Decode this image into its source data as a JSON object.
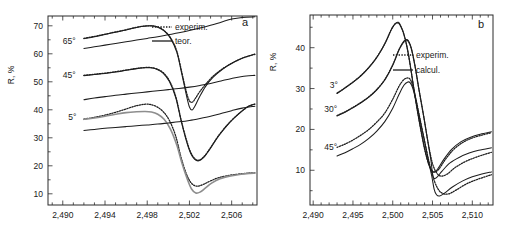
{
  "figure": {
    "background": "#ffffff",
    "curve_color": "#1d1d1d",
    "gray_curve_color": "#8e8e8e",
    "axis_color": "#2b2b2b"
  },
  "chart_data": [
    {
      "type": "line",
      "panel_letter": "a",
      "title": "",
      "xlabel": "",
      "ylabel": "R, %",
      "xlim": [
        2488.6,
        2508.4
      ],
      "ylim": [
        6.0,
        73.5
      ],
      "xticks": [
        2490,
        2494,
        2498,
        2502,
        2506
      ],
      "xtick_labels": [
        "2,490",
        "2,494",
        "2,498",
        "2,502",
        "2,506"
      ],
      "xminor_step": 1,
      "yticks": [
        10,
        20,
        30,
        40,
        50,
        60,
        70
      ],
      "ytick_labels": [
        "10",
        "20",
        "30",
        "40",
        "50",
        "60",
        "70"
      ],
      "yminor_step": 5,
      "grid": false,
      "legend_position": "top-right",
      "legend": [
        {
          "label": "experim.",
          "style": "dotted"
        },
        {
          "label": "teor.",
          "style": "solid"
        }
      ],
      "annotations": [
        {
          "text": "65°",
          "x": 2490.6,
          "y": 63.5
        },
        {
          "text": "45°",
          "x": 2490.6,
          "y": 51.5
        },
        {
          "text": "5°",
          "x": 2490.9,
          "y": 36.5
        }
      ],
      "series": [
        {
          "name": "65° experim.",
          "angle": "65°",
          "style": "dotted",
          "color": "#1d1d1d",
          "x": [
            2492.0,
            2493.0,
            2494.0,
            2495.0,
            2496.0,
            2497.0,
            2497.8,
            2498.4,
            2499.0,
            2499.6,
            2500.2,
            2500.8,
            2501.3,
            2501.7,
            2502.0,
            2502.3,
            2502.6,
            2503.0,
            2503.6,
            2504.3,
            2505.2,
            2506.2,
            2507.2,
            2508.2
          ],
          "y": [
            65.5,
            66.2,
            67.0,
            67.8,
            68.6,
            69.5,
            69.9,
            70.0,
            69.6,
            68.3,
            65.8,
            61.0,
            53.0,
            46.5,
            43.2,
            42.8,
            44.3,
            46.6,
            49.4,
            52.2,
            54.8,
            57.0,
            58.7,
            59.8
          ]
        },
        {
          "name": "65° teor.",
          "angle": "65°",
          "style": "solid",
          "color": "#1d1d1d",
          "x": [
            2492.0,
            2493.0,
            2494.0,
            2495.0,
            2496.0,
            2497.0,
            2497.8,
            2498.4,
            2499.0,
            2499.6,
            2500.2,
            2500.8,
            2501.3,
            2501.7,
            2502.0,
            2502.25,
            2502.5,
            2502.9,
            2503.5,
            2504.2,
            2505.1,
            2506.1,
            2507.1,
            2508.2
          ],
          "y": [
            65.4,
            66.1,
            66.9,
            67.7,
            68.5,
            69.4,
            69.9,
            70.0,
            69.5,
            68.2,
            65.6,
            60.6,
            52.4,
            45.4,
            41.0,
            39.9,
            41.2,
            44.2,
            48.2,
            51.5,
            54.4,
            56.8,
            58.6,
            59.9
          ]
        },
        {
          "name": "65° lower branch",
          "angle": "65°",
          "style": "solid",
          "color": "#1d1d1d",
          "x": [
            2492.0,
            2493.0,
            2494.0,
            2495.0,
            2496.0,
            2497.0,
            2498.0,
            2499.0,
            2500.0,
            2501.0,
            2502.0,
            2503.0,
            2504.0,
            2505.0,
            2506.0,
            2507.0,
            2508.2
          ],
          "y": [
            61.9,
            62.5,
            63.1,
            63.7,
            64.3,
            64.9,
            65.5,
            66.1,
            66.8,
            67.5,
            68.3,
            69.2,
            70.2,
            71.3,
            72.4,
            73.0,
            73.2
          ]
        },
        {
          "name": "45° experim.",
          "angle": "45°",
          "style": "dotted",
          "color": "#1d1d1d",
          "x": [
            2492.0,
            2493.0,
            2494.0,
            2495.0,
            2496.0,
            2497.0,
            2497.8,
            2498.3,
            2498.9,
            2499.5,
            2500.1,
            2500.7,
            2501.2,
            2501.7,
            2502.1,
            2502.5,
            2502.9,
            2503.4,
            2504.0,
            2504.8,
            2505.8,
            2506.8,
            2507.6,
            2508.2
          ],
          "y": [
            52.3,
            52.7,
            53.1,
            53.6,
            54.2,
            54.8,
            55.1,
            55.1,
            54.6,
            53.3,
            50.4,
            44.8,
            36.6,
            29.5,
            25.0,
            22.6,
            22.0,
            23.4,
            26.5,
            31.0,
            35.5,
            39.0,
            41.2,
            42.0
          ]
        },
        {
          "name": "45° teor.",
          "angle": "45°",
          "style": "solid",
          "color": "#1d1d1d",
          "x": [
            2492.0,
            2493.0,
            2494.0,
            2495.0,
            2496.0,
            2497.0,
            2497.8,
            2498.3,
            2498.9,
            2499.5,
            2500.1,
            2500.7,
            2501.2,
            2501.7,
            2502.1,
            2502.5,
            2502.9,
            2503.4,
            2504.0,
            2504.8,
            2505.8,
            2506.8,
            2507.6,
            2508.2
          ],
          "y": [
            52.2,
            52.6,
            53.0,
            53.5,
            54.1,
            54.7,
            55.0,
            55.0,
            54.5,
            53.1,
            50.1,
            44.4,
            36.2,
            29.0,
            24.6,
            22.3,
            21.8,
            23.2,
            26.3,
            30.8,
            35.4,
            39.0,
            41.3,
            42.1
          ]
        },
        {
          "name": "45° lower branch",
          "angle": "45°",
          "style": "solid",
          "color": "#1d1d1d",
          "x": [
            2492.0,
            2493.0,
            2494.0,
            2495.0,
            2496.0,
            2497.0,
            2498.0,
            2499.0,
            2500.0,
            2501.0,
            2502.0,
            2503.0,
            2504.0,
            2505.0,
            2506.0,
            2507.0,
            2508.2
          ],
          "y": [
            43.6,
            44.2,
            44.7,
            45.2,
            45.6,
            46.0,
            46.4,
            46.8,
            47.2,
            47.6,
            48.1,
            48.7,
            49.4,
            50.3,
            51.2,
            51.9,
            52.3
          ]
        },
        {
          "name": "5° experim.",
          "angle": "5°",
          "style": "dotted",
          "color": "#1d1d1d",
          "x": [
            2492.0,
            2493.0,
            2494.0,
            2495.0,
            2496.0,
            2497.0,
            2497.8,
            2498.3,
            2498.9,
            2499.5,
            2500.1,
            2500.7,
            2501.2,
            2501.7,
            2502.1,
            2502.5,
            2502.9,
            2503.4,
            2504.0,
            2504.8,
            2505.8,
            2506.8,
            2507.6,
            2508.2
          ],
          "y": [
            36.7,
            37.3,
            38.1,
            39.1,
            40.3,
            41.5,
            42.0,
            41.9,
            41.1,
            39.4,
            36.2,
            30.6,
            23.1,
            17.2,
            14.2,
            12.9,
            12.8,
            13.5,
            14.6,
            15.8,
            16.6,
            17.1,
            17.4,
            17.5
          ]
        },
        {
          "name": "5° teor.",
          "angle": "5°",
          "style": "solid",
          "color": "#8e8e8e",
          "x": [
            2492.0,
            2493.0,
            2494.0,
            2495.0,
            2496.0,
            2497.0,
            2497.8,
            2498.4,
            2499.0,
            2499.6,
            2500.2,
            2500.8,
            2501.3,
            2501.8,
            2502.2,
            2502.6,
            2503.0,
            2503.5,
            2504.1,
            2504.9,
            2505.9,
            2506.9,
            2507.7,
            2508.2
          ],
          "y": [
            36.6,
            37.1,
            37.7,
            38.4,
            39.0,
            39.3,
            39.4,
            39.2,
            38.4,
            36.6,
            33.1,
            27.4,
            20.8,
            15.2,
            11.7,
            10.3,
            10.6,
            12.0,
            13.8,
            15.4,
            16.4,
            17.0,
            17.3,
            17.4
          ]
        },
        {
          "name": "5° lower branch",
          "angle": "5°",
          "style": "solid",
          "color": "#1d1d1d",
          "x": [
            2492.0,
            2493.0,
            2494.0,
            2495.0,
            2496.0,
            2497.0,
            2498.0,
            2499.0,
            2500.0,
            2501.0,
            2502.0,
            2503.0,
            2504.0,
            2505.0,
            2506.0,
            2507.0,
            2508.2
          ],
          "y": [
            32.6,
            33.0,
            33.4,
            33.7,
            34.0,
            34.3,
            34.6,
            34.9,
            35.3,
            35.7,
            36.2,
            36.9,
            37.7,
            38.7,
            39.7,
            40.6,
            41.3
          ]
        }
      ]
    },
    {
      "type": "line",
      "panel_letter": "b",
      "title": "",
      "xlabel": "",
      "ylabel": "R, %",
      "xlim": [
        2489.6,
        2512.6
      ],
      "ylim": [
        1.5,
        48.0
      ],
      "xticks": [
        2490,
        2495,
        2500,
        2505,
        2510
      ],
      "xtick_labels": [
        "2,490",
        "2,495",
        "2,500",
        "2,505",
        "2,510"
      ],
      "xminor_step": 1,
      "yticks": [
        10,
        20,
        30,
        40
      ],
      "ytick_labels": [
        "10",
        "20",
        "30",
        "40"
      ],
      "yminor_step": 5,
      "grid": false,
      "legend_position": "center-right",
      "legend": [
        {
          "label": "experim.",
          "style": "dotted"
        },
        {
          "label": "calcul.",
          "style": "solid"
        }
      ],
      "annotations": [
        {
          "text": "3°",
          "x": 2492.6,
          "y": 30.2
        },
        {
          "text": "30°",
          "x": 2492.2,
          "y": 24.2
        },
        {
          "text": "45°",
          "x": 2492.2,
          "y": 15.0
        }
      ],
      "series": [
        {
          "name": "3° experim.",
          "angle": "3°",
          "style": "dotted",
          "color": "#1d1d1d",
          "x": [
            2493.0,
            2494.0,
            2495.0,
            2496.0,
            2497.0,
            2498.0,
            2499.0,
            2499.8,
            2500.3,
            2500.7,
            2501.0,
            2501.4,
            2501.8,
            2502.2,
            2502.8,
            2503.4,
            2504.0,
            2504.5,
            2504.9,
            2505.3,
            2505.8,
            2506.6,
            2507.6,
            2508.8,
            2510.0,
            2511.2,
            2512.4
          ],
          "y": [
            28.9,
            30.2,
            31.6,
            33.2,
            35.2,
            37.7,
            41.0,
            44.4,
            45.8,
            46.0,
            45.2,
            43.2,
            40.0,
            35.6,
            28.0,
            21.2,
            15.2,
            11.6,
            10.0,
            9.6,
            10.3,
            12.6,
            15.0,
            16.8,
            17.9,
            18.6,
            19.2
          ]
        },
        {
          "name": "3° calcul.",
          "angle": "3°",
          "style": "solid",
          "color": "#1d1d1d",
          "x": [
            2493.0,
            2494.0,
            2495.0,
            2496.0,
            2497.0,
            2498.0,
            2499.0,
            2499.8,
            2500.3,
            2500.7,
            2501.0,
            2501.4,
            2501.8,
            2502.2,
            2502.8,
            2503.4,
            2504.0,
            2504.5,
            2504.9,
            2505.2,
            2505.6,
            2506.4,
            2507.4,
            2508.6,
            2509.8,
            2511.0,
            2512.4
          ],
          "y": [
            28.8,
            30.1,
            31.5,
            33.1,
            35.1,
            37.6,
            40.9,
            44.3,
            45.9,
            46.2,
            45.4,
            43.4,
            40.2,
            35.8,
            28.2,
            21.4,
            15.4,
            11.6,
            9.9,
            9.5,
            10.2,
            12.6,
            15.1,
            17.0,
            18.1,
            18.8,
            19.4
          ]
        },
        {
          "name": "30° experim.",
          "angle": "30°",
          "style": "dotted",
          "color": "#1d1d1d",
          "x": [
            2493.0,
            2494.0,
            2495.0,
            2496.0,
            2497.0,
            2498.0,
            2499.0,
            2500.0,
            2500.8,
            2501.4,
            2501.8,
            2502.1,
            2502.4,
            2502.8,
            2503.3,
            2503.9,
            2504.4,
            2504.8,
            2505.1,
            2505.5,
            2506.0,
            2506.8,
            2507.8,
            2509.0,
            2510.2,
            2511.4,
            2512.4
          ],
          "y": [
            23.4,
            24.3,
            25.4,
            26.6,
            28.0,
            29.8,
            32.2,
            35.8,
            39.5,
            41.4,
            41.8,
            41.0,
            39.2,
            35.4,
            29.6,
            23.0,
            17.2,
            13.2,
            11.0,
            9.4,
            8.6,
            9.0,
            10.6,
            12.0,
            13.0,
            13.8,
            14.4
          ]
        },
        {
          "name": "30° calcul.",
          "angle": "30°",
          "style": "solid",
          "color": "#1d1d1d",
          "x": [
            2493.0,
            2494.0,
            2495.0,
            2496.0,
            2497.0,
            2498.0,
            2499.0,
            2500.0,
            2500.8,
            2501.4,
            2501.8,
            2502.1,
            2502.4,
            2502.8,
            2503.3,
            2503.9,
            2504.4,
            2504.8,
            2505.0,
            2505.2,
            2505.6,
            2506.2,
            2507.2,
            2508.4,
            2509.6,
            2510.8,
            2512.4
          ],
          "y": [
            23.3,
            24.2,
            25.3,
            26.5,
            27.9,
            29.7,
            32.1,
            35.7,
            39.6,
            41.6,
            42.0,
            41.2,
            39.4,
            35.6,
            29.8,
            23.2,
            17.2,
            12.4,
            9.2,
            8.0,
            8.4,
            9.8,
            11.8,
            13.2,
            14.2,
            14.9,
            15.5
          ]
        },
        {
          "name": "45° experim.",
          "angle": "45°",
          "style": "dotted",
          "color": "#1d1d1d",
          "x": [
            2493.0,
            2494.0,
            2495.0,
            2496.0,
            2497.0,
            2498.0,
            2499.0,
            2500.0,
            2500.8,
            2501.4,
            2501.9,
            2502.2,
            2502.5,
            2502.9,
            2503.4,
            2504.0,
            2504.5,
            2504.9,
            2505.3,
            2505.7,
            2506.2,
            2507.0,
            2508.0,
            2509.2,
            2510.4,
            2511.6,
            2512.4
          ],
          "y": [
            15.6,
            16.4,
            17.4,
            18.6,
            20.0,
            21.8,
            24.0,
            27.4,
            30.6,
            32.2,
            32.6,
            32.2,
            30.8,
            27.6,
            22.8,
            17.2,
            12.6,
            9.4,
            7.0,
            5.4,
            4.4,
            4.2,
            5.2,
            6.6,
            7.6,
            8.4,
            8.9
          ]
        },
        {
          "name": "45° calcul.",
          "angle": "45°",
          "style": "solid",
          "color": "#1d1d1d",
          "x": [
            2493.0,
            2494.0,
            2495.0,
            2496.0,
            2497.0,
            2498.0,
            2499.0,
            2500.0,
            2500.8,
            2501.4,
            2501.9,
            2502.2,
            2502.5,
            2502.9,
            2503.4,
            2504.0,
            2504.5,
            2504.9,
            2505.2,
            2505.5,
            2505.9,
            2506.5,
            2507.5,
            2508.8,
            2510.0,
            2511.2,
            2512.4
          ],
          "y": [
            13.5,
            14.3,
            15.3,
            16.4,
            17.8,
            19.6,
            21.9,
            25.2,
            28.6,
            30.8,
            31.6,
            31.4,
            30.2,
            27.2,
            22.6,
            17.0,
            12.2,
            8.6,
            5.4,
            4.0,
            3.7,
            4.4,
            5.9,
            7.4,
            8.4,
            9.1,
            9.6
          ]
        }
      ]
    }
  ]
}
